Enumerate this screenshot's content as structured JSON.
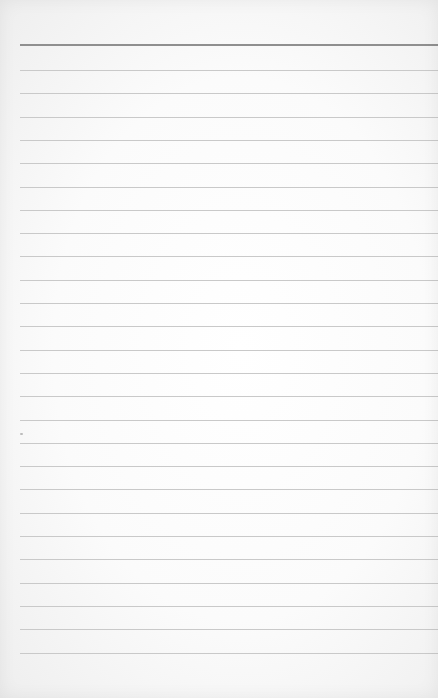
{
  "page": {
    "type": "lined-paper",
    "background_color": "#fbfbfb",
    "header_rule": {
      "y": 45,
      "color": "#8f8f8f",
      "thickness": 2
    },
    "rules": {
      "count": 26,
      "start_y": 70,
      "spacing": 23.3,
      "color": "#c9c9c9",
      "left_margin": 20
    }
  }
}
